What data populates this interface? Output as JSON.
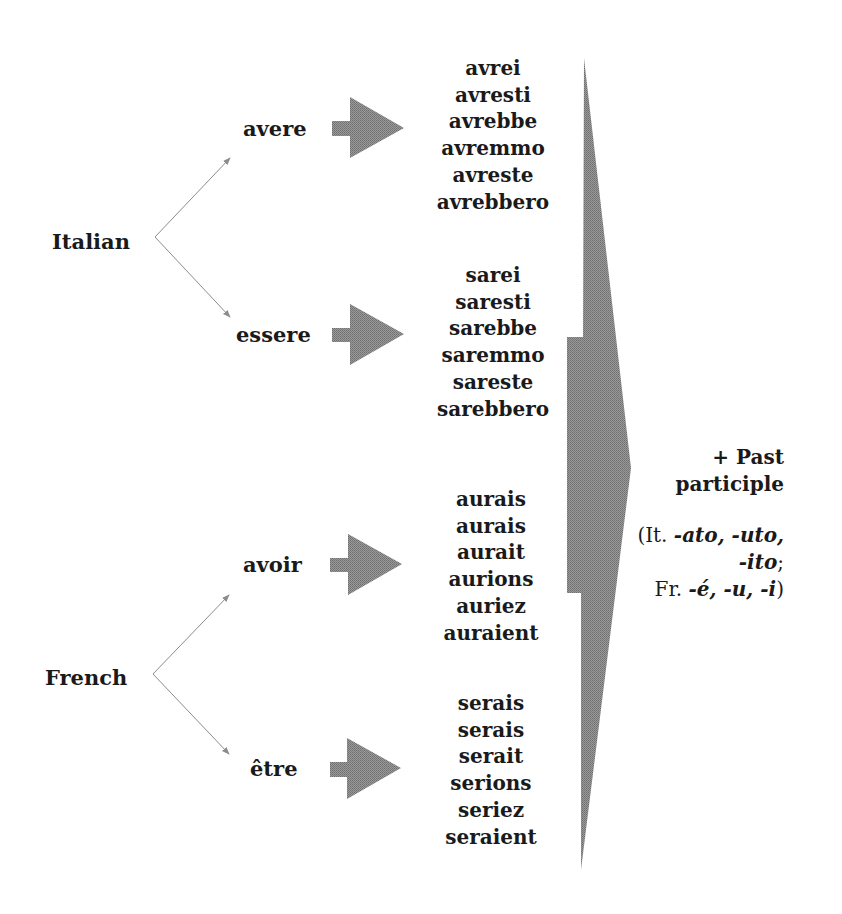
{
  "diagram": {
    "languages": [
      {
        "name": "Italian",
        "verbs": [
          {
            "infinitive": "avere",
            "forms": [
              "avrei",
              "avresti",
              "avrebbe",
              "avremmo",
              "avreste",
              "avrebbero"
            ]
          },
          {
            "infinitive": "essere",
            "forms": [
              "sarei",
              "saresti",
              "sarebbe",
              "saremmo",
              "sareste",
              "sarebbero"
            ]
          }
        ]
      },
      {
        "name": "French",
        "verbs": [
          {
            "infinitive": "avoir",
            "forms": [
              "aurais",
              "aurais",
              "aurait",
              "aurions",
              "auriez",
              "auraient"
            ]
          },
          {
            "infinitive": "être",
            "forms": [
              "serais",
              "serais",
              "serait",
              "serions",
              "seriez",
              "seraient"
            ]
          }
        ]
      }
    ],
    "result": {
      "line1": "+ Past",
      "line2": "participle",
      "it_prefix": "(It. ",
      "it_endings_1": "-ato, -uto,",
      "it_endings_2": "-ito",
      "it_sep": ";",
      "fr_prefix": "Fr. ",
      "fr_endings": "-é, -u, -i",
      "close": ")"
    },
    "colors": {
      "arrow_fill": "#8a8a8a",
      "connector": "#8c8c8c",
      "text": "#1a1a1a"
    }
  }
}
